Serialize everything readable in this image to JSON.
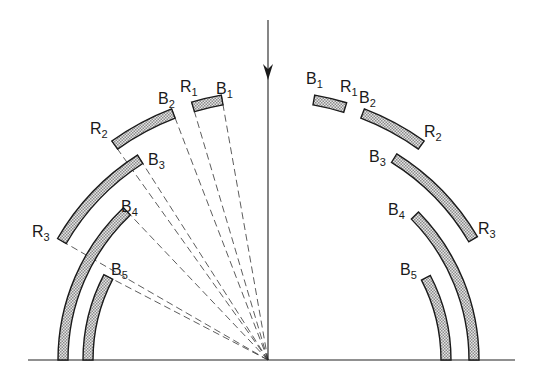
{
  "figure": {
    "width": 533,
    "height": 383,
    "center": {
      "x": 268,
      "y": 360
    },
    "baseline": {
      "y": 360,
      "x_start": 28,
      "x_end": 515
    },
    "incident_arrow": {
      "x": 268,
      "y_top": 20,
      "head_y": 80,
      "y_bottom": 360,
      "icon": "arrow-down-icon"
    },
    "colors": {
      "ink": "#1a1a1a",
      "band_fill": "#cfcfcf",
      "background": "#ffffff"
    },
    "band_thickness": 10
  },
  "left_segments": [
    {
      "id": "R1-B1",
      "radius": 264,
      "angle_start": 10,
      "angle_end": 16.5,
      "dashed_to_endpoints": true
    },
    {
      "id": "R2-B2",
      "radius": 264,
      "angle_start": 21,
      "angle_end": 35.5,
      "dashed_to_endpoints": true
    },
    {
      "id": "R3-B3",
      "radius": 238,
      "angle_start": 32.5,
      "angle_end": 60,
      "dashed_to_endpoints": true
    },
    {
      "id": "B4",
      "radius": 205,
      "angle_start": 43.5,
      "angle_end": 90,
      "dashed_to_endpoints": true
    },
    {
      "id": "B5",
      "radius": 180,
      "angle_start": 62.5,
      "angle_end": 90,
      "dashed_to_endpoints": true
    }
  ],
  "right_segments": [
    {
      "id": "B1-R1",
      "radius": 264,
      "angle_start": 10,
      "angle_end": 17
    },
    {
      "id": "B2-R2",
      "radius": 264,
      "angle_start": 21,
      "angle_end": 35.5
    },
    {
      "id": "B3-R3",
      "radius": 238,
      "angle_start": 32,
      "angle_end": 59.5
    },
    {
      "id": "B4",
      "radius": 206,
      "angle_start": 45.5,
      "angle_end": 90
    },
    {
      "id": "B5",
      "radius": 178,
      "angle_start": 62.5,
      "angle_end": 90
    }
  ],
  "labels": [
    {
      "name": "label-left-b1",
      "base": "B",
      "sub": "1",
      "x": 216,
      "y": 94
    },
    {
      "name": "label-left-r1",
      "base": "R",
      "sub": "1",
      "x": 180,
      "y": 92
    },
    {
      "name": "label-left-b2",
      "base": "B",
      "sub": "2",
      "x": 158,
      "y": 104
    },
    {
      "name": "label-left-r2",
      "base": "R",
      "sub": "2",
      "x": 90,
      "y": 134
    },
    {
      "name": "label-left-b3",
      "base": "B",
      "sub": "3",
      "x": 148,
      "y": 165
    },
    {
      "name": "label-left-r3",
      "base": "R",
      "sub": "3",
      "x": 32,
      "y": 237
    },
    {
      "name": "label-left-b4",
      "base": "B",
      "sub": "4",
      "x": 121,
      "y": 212
    },
    {
      "name": "label-left-b5",
      "base": "B",
      "sub": "5",
      "x": 111,
      "y": 275
    },
    {
      "name": "label-right-b1",
      "base": "B",
      "sub": "1",
      "x": 306,
      "y": 84
    },
    {
      "name": "label-right-r1",
      "base": "R",
      "sub": "1",
      "x": 340,
      "y": 92
    },
    {
      "name": "label-right-b2",
      "base": "B",
      "sub": "2",
      "x": 359,
      "y": 103
    },
    {
      "name": "label-right-r2",
      "base": "R",
      "sub": "2",
      "x": 424,
      "y": 137
    },
    {
      "name": "label-right-b3",
      "base": "B",
      "sub": "3",
      "x": 369,
      "y": 162
    },
    {
      "name": "label-right-r3",
      "base": "R",
      "sub": "3",
      "x": 478,
      "y": 234
    },
    {
      "name": "label-right-b4",
      "base": "B",
      "sub": "4",
      "x": 388,
      "y": 215
    },
    {
      "name": "label-right-b5",
      "base": "B",
      "sub": "5",
      "x": 400,
      "y": 275
    }
  ]
}
